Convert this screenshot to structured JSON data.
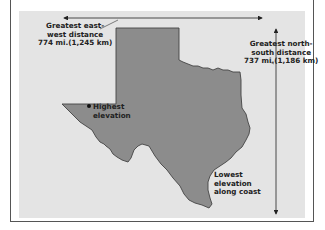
{
  "figure": {
    "colors": {
      "panel": "#e4e4e4",
      "state_fill": "#8c8c8c",
      "state_outline": "#444444",
      "text": "#222222"
    }
  },
  "labels": {
    "east_west": {
      "line1": "Greatest east-",
      "line2": "west distance",
      "line3": "774 mi.(1,245 km)"
    },
    "north_south": {
      "line1": "Greatest north-",
      "line2": "south distance",
      "line3": "737 mi.(1,186 km)"
    },
    "highest": {
      "line1": "Highest",
      "line2": "elevation"
    },
    "lowest": {
      "line1": "Lowest",
      "line2": "elevation",
      "line3": "along coast"
    }
  },
  "markers": {
    "highest_point_icon": "dot-marker"
  },
  "arrows": {
    "east_west": {
      "from_x": 62,
      "to_x": 262,
      "y": 18
    },
    "north_south": {
      "x": 276,
      "from_y": 28,
      "to_y": 214
    }
  }
}
